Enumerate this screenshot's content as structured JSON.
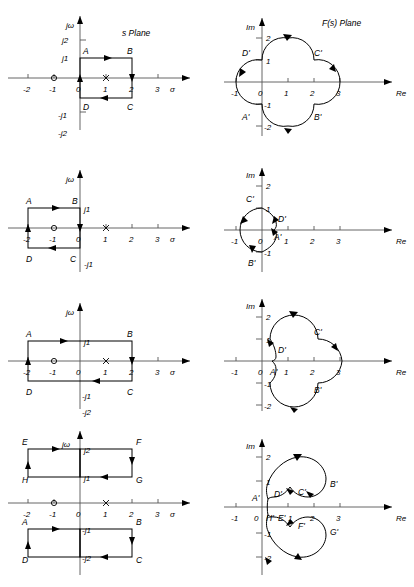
{
  "figure": {
    "title_left": "s Plane",
    "title_right": "F(s) Plane",
    "rows": [
      {
        "id": "row-1",
        "s_plane": {
          "axis_x_label": "σ",
          "axis_y_label": "jω",
          "x_ticks": [
            "-2",
            "-1",
            "0",
            "1",
            "2",
            "3"
          ],
          "y_ticks": [
            "j2",
            "j1",
            "-j1",
            "-j2"
          ],
          "zero_at": "-1",
          "pole_at": "1",
          "contour_points": [
            "A",
            "B",
            "C",
            "D"
          ],
          "contour_desc": "square 0 to 2, -j1 to j1"
        },
        "f_plane": {
          "axis_x_label": "Re",
          "axis_y_label": "Im",
          "x_ticks": [
            "-1",
            "0",
            "1",
            "2",
            "3"
          ],
          "y_ticks": [
            "2",
            "1",
            "-1",
            "-2"
          ],
          "contour_points": [
            "A'",
            "B'",
            "C'",
            "D'"
          ],
          "contour_desc": "four-lobed clover centred at 1+j0"
        }
      },
      {
        "id": "row-2",
        "s_plane": {
          "axis_x_label": "σ",
          "axis_y_label": "jω",
          "x_ticks": [
            "-2",
            "-1",
            "0",
            "1",
            "2",
            "3"
          ],
          "y_ticks": [
            "j1",
            "-j1",
            "-j2"
          ],
          "zero_at": "-1",
          "pole_at": "1",
          "contour_points": [
            "A",
            "B",
            "C",
            "D"
          ],
          "contour_desc": "square -2 to 0, -j1 to j1"
        },
        "f_plane": {
          "axis_x_label": "Re",
          "axis_y_label": "Im",
          "x_ticks": [
            "-1",
            "0",
            "1",
            "2",
            "3"
          ],
          "y_ticks": [
            "2",
            "1",
            "-1"
          ],
          "contour_points": [
            "A'",
            "B'",
            "C'",
            "D'"
          ],
          "contour_desc": "large left loop with small inner cusp near origin"
        }
      },
      {
        "id": "row-3",
        "s_plane": {
          "axis_x_label": "σ",
          "axis_y_label": "jω",
          "x_ticks": [
            "-2",
            "-1",
            "0",
            "1",
            "2",
            "3"
          ],
          "y_ticks": [
            "j1",
            "-j1",
            "-j2"
          ],
          "zero_at": "-1",
          "pole_at": "1",
          "contour_points": [
            "A",
            "B",
            "C",
            "D"
          ],
          "contour_desc": "rectangle -2 to 2, -j1 to j1"
        },
        "f_plane": {
          "axis_x_label": "Re",
          "axis_y_label": "Im",
          "x_ticks": [
            "-1",
            "0",
            "1",
            "2",
            "3"
          ],
          "y_ticks": [
            "2",
            "1",
            "-1",
            "-2"
          ],
          "contour_points": [
            "A'",
            "B'",
            "C'",
            "D'"
          ],
          "contour_desc": "three-lobed loop reaching Re = 3"
        }
      },
      {
        "id": "row-4",
        "s_plane": {
          "axis_x_label": "σ",
          "axis_y_label": "jω",
          "x_ticks": [
            "-2",
            "-1",
            "0",
            "1",
            "2",
            "3"
          ],
          "y_ticks": [
            "j2",
            "j1",
            "-j1",
            "-j2"
          ],
          "zero_at": "-1",
          "pole_at": "1",
          "contour_points": [
            "A",
            "B",
            "C",
            "D",
            "E",
            "F",
            "G",
            "H"
          ],
          "contour_desc": "upper rectangle EFGH between j1 and j2; lower rectangle ABCD between -j1 and -j2"
        },
        "f_plane": {
          "axis_x_label": "Re",
          "axis_y_label": "Im",
          "x_ticks": [
            "-1",
            "0",
            "1",
            "2",
            "3"
          ],
          "y_ticks": [
            "2",
            "1",
            "-1",
            "-2"
          ],
          "contour_points": [
            "A'",
            "B'",
            "C'",
            "D'",
            "E'",
            "F'",
            "G'",
            "H'"
          ],
          "contour_desc": "two spiral lobes above and below the real axis"
        }
      }
    ]
  }
}
